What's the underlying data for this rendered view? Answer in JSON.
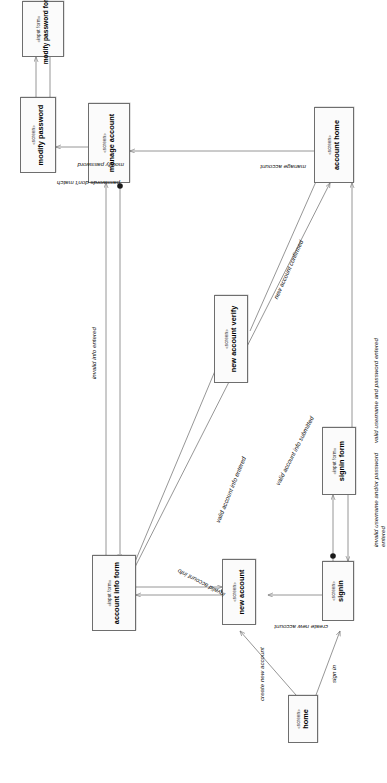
{
  "diagram": {
    "type": "uml-state-navigation-diagram",
    "orientation": "rotated-90-counterclockwise",
    "nodes": [
      {
        "id": "home",
        "stereotype": "«screen»",
        "name": "home"
      },
      {
        "id": "signin",
        "stereotype": "«screen»",
        "name": "signin"
      },
      {
        "id": "signin_form",
        "stereotype": "«input form»",
        "name": "signin form"
      },
      {
        "id": "new_account",
        "stereotype": "«screen»",
        "name": "new account"
      },
      {
        "id": "account_info_form",
        "stereotype": "«input form»",
        "name": "account info form"
      },
      {
        "id": "new_account_verify",
        "stereotype": "«screen»",
        "name": "new account verify"
      },
      {
        "id": "account_home",
        "stereotype": "«screen»",
        "name": "account home"
      },
      {
        "id": "manage_account",
        "stereotype": "«screen»",
        "name": "manage account"
      },
      {
        "id": "modify_password_form",
        "stereotype": "«input form»",
        "name": "modify password form"
      },
      {
        "id": "modify_password",
        "stereotype": "«screen»",
        "name": "modify password"
      }
    ],
    "edges": [
      {
        "id": "e1",
        "from": "home",
        "to": "signin",
        "label": "sign in"
      },
      {
        "id": "e2",
        "from": "home",
        "to": "new_account",
        "label": "create new account"
      },
      {
        "id": "e3",
        "from": "signin",
        "to": "new_account",
        "label": "create new account"
      },
      {
        "id": "e4",
        "from": "signin",
        "to": "signin_form",
        "label": ""
      },
      {
        "id": "e5",
        "from": "signin_form",
        "to": "signin",
        "label": "invalid username and/or password entered"
      },
      {
        "id": "e6",
        "from": "signin_form",
        "to": "account_home",
        "label": "valid username and password entered"
      },
      {
        "id": "e7",
        "from": "new_account",
        "to": "account_info_form",
        "label": ""
      },
      {
        "id": "e8",
        "from": "account_info_form",
        "to": "new_account",
        "label": "invalid account info"
      },
      {
        "id": "e9",
        "from": "account_info_form",
        "to": "new_account_verify",
        "label": "valid account info entered"
      },
      {
        "id": "e10",
        "from": "account_info_form",
        "to": "account_home",
        "label": "valid account info submitted"
      },
      {
        "id": "e11",
        "from": "new_account_verify",
        "to": "account_home",
        "label": "new account confirmed"
      },
      {
        "id": "e12",
        "from": "account_home",
        "to": "manage_account",
        "label": "manage account"
      },
      {
        "id": "e13",
        "from": "manage_account",
        "to": "account_info_form",
        "label": ""
      },
      {
        "id": "e14",
        "from": "account_info_form",
        "to": "manage_account",
        "label": "invalid info entered"
      },
      {
        "id": "e15",
        "from": "manage_account",
        "to": "modify_password",
        "label": "modify password"
      },
      {
        "id": "e16",
        "from": "modify_password",
        "to": "modify_password_form",
        "label": ""
      },
      {
        "id": "e17",
        "from": "modify_password_form",
        "to": "modify_password",
        "label": "passwords don't match"
      }
    ],
    "colors": {
      "node_fill": "#fbfbfb",
      "node_border": "#6e6e6e",
      "edge": "#7b7b7b",
      "text": "#000000",
      "background": "#ffffff"
    }
  }
}
